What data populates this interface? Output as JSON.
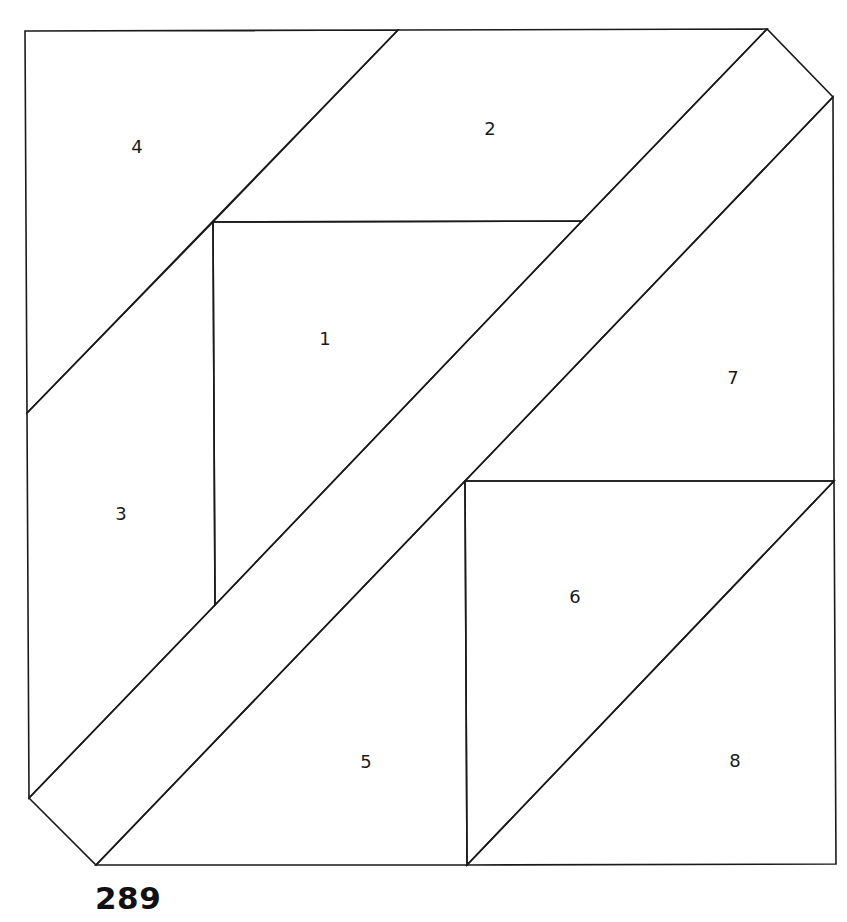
{
  "pattern_number": "289",
  "colors": {
    "line": "#1a1a1a",
    "background": "#ffffff"
  },
  "pieces": [
    {
      "label": "1",
      "x": 325,
      "y": 345,
      "points": "213,222 582,221 215,605"
    },
    {
      "label": "2",
      "x": 490,
      "y": 135,
      "points": "398,30 767,29 582,221 213,222"
    },
    {
      "label": "3",
      "x": 121,
      "y": 520,
      "points": "27,413 213,222 215,605 29,798"
    },
    {
      "label": "4",
      "x": 137,
      "y": 153,
      "points": "25,31 398,30 27,413"
    },
    {
      "label": "5",
      "x": 366,
      "y": 768,
      "points": "465,481 467,865 96,865"
    },
    {
      "label": "6",
      "x": 575,
      "y": 603,
      "points": "465,481 834,481 467,865"
    },
    {
      "label": "7",
      "x": 733,
      "y": 384,
      "points": "833,97 834,481 465,481"
    },
    {
      "label": "8",
      "x": 735,
      "y": 767,
      "points": "834,481 836,864 467,865"
    }
  ],
  "strips": [
    {
      "name": "diagonal-strip",
      "points": "582,221 767,29 833,97 465,481 96,865 29,798 215,605"
    }
  ]
}
